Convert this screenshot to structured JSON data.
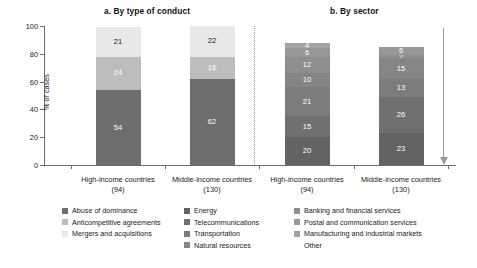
{
  "chart_data": {
    "type": "bar",
    "subtype": "stacked-100",
    "panels": [
      {
        "id": "a",
        "title": "a. By type of conduct",
        "categories": [
          "High-income countries",
          "Middle-income countries"
        ],
        "category_counts": [
          "(94)",
          "(130)"
        ],
        "series": [
          {
            "name": "Abuse of dominance",
            "color": "#6e6e6e",
            "values": [
              54,
              62
            ],
            "label_color": "light"
          },
          {
            "name": "Anticompetitive agreements",
            "color": "#bdbdbd",
            "values": [
              24,
              16
            ],
            "label_color": "light"
          },
          {
            "name": "Mergers and acquisitions",
            "color": "#e8e8e8",
            "values": [
              21,
              22
            ],
            "label_color": "dark"
          }
        ]
      },
      {
        "id": "b",
        "title": "b. By sector",
        "categories": [
          "High-income countries",
          "Middle-income countries"
        ],
        "category_counts": [
          "(94)",
          "(130)"
        ],
        "series": [
          {
            "name": "Energy",
            "color": "#636363",
            "values": [
              20,
              23
            ],
            "label_color": "light"
          },
          {
            "name": "Telecommunications",
            "color": "#707070",
            "values": [
              15,
              26
            ],
            "label_color": "light"
          },
          {
            "name": "Transportation",
            "color": "#7c7c7c",
            "values": [
              21,
              13
            ],
            "label_color": "light"
          },
          {
            "name": "Natural resources",
            "color": "#858585",
            "values": [
              10,
              15
            ],
            "label_color": "light"
          },
          {
            "name": "Banking and financial services",
            "color": "#8e8e8e",
            "values": [
              12,
              2
            ],
            "label_color": "light"
          },
          {
            "name": "Postal and communication services",
            "color": "#979797",
            "values": [
              6,
              6
            ],
            "label_color": "light"
          },
          {
            "name": "Manufacturing and industrial markets",
            "color": "#a3a3a3",
            "values": [
              4,
              0
            ],
            "label_color": "light"
          },
          {
            "name": "Other",
            "color": "#ffffff",
            "values": [
              12,
              15
            ],
            "label_color": "dark"
          }
        ]
      }
    ],
    "ylabel": "% of cases",
    "yticks": [
      0,
      20,
      40,
      60,
      80,
      100
    ],
    "ylim": [
      0,
      100
    ],
    "xlabel": "",
    "grid": false,
    "legend_position": "bottom"
  },
  "legend": {
    "columns": [
      [
        {
          "label": "Abuse of dominance",
          "color": "#6e6e6e"
        },
        {
          "label": "Anticompetitive agreements",
          "color": "#bdbdbd"
        },
        {
          "label": "Mergers and acquisitions",
          "color": "#e8e8e8"
        }
      ],
      [
        {
          "label": "Energy",
          "color": "#636363"
        },
        {
          "label": "Telecommunications",
          "color": "#707070"
        },
        {
          "label": "Transportation",
          "color": "#7c7c7c"
        },
        {
          "label": "Natural resources",
          "color": "#858585"
        }
      ],
      [
        {
          "label": "Banking and financial services",
          "color": "#8e8e8e"
        },
        {
          "label": "Postal and communication services",
          "color": "#979797"
        },
        {
          "label": "Manufacturing and industrial markets",
          "color": "#a3a3a3"
        },
        {
          "label": "Other",
          "color": "#ffffff"
        }
      ]
    ]
  },
  "annotation": {
    "right_arrow": "downward-arrow"
  }
}
